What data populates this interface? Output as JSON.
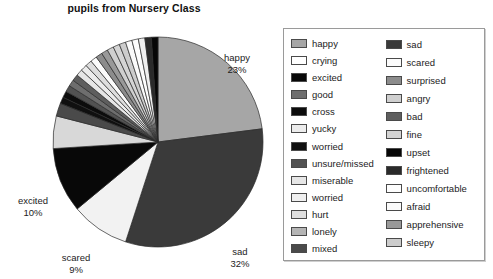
{
  "chart_data": {
    "type": "pie",
    "title": "pupils from Nursery Class",
    "xlabel": "",
    "ylabel": "",
    "legend_position": "right",
    "grid": false,
    "categories": [
      "happy",
      "crying",
      "excited",
      "good",
      "cross",
      "yucky",
      "worried",
      "unsure/missed",
      "miserable",
      "worried",
      "hurt",
      "lonely",
      "mixed",
      "sad",
      "scared",
      "surprised",
      "angry",
      "bad",
      "fine",
      "upset",
      "frightened",
      "uncomfortable",
      "afraid",
      "apprehensive",
      "sleepy"
    ],
    "values": [
      23,
      1,
      10,
      1,
      1,
      1,
      1,
      1,
      1,
      1,
      1,
      5,
      2,
      32,
      9,
      1,
      1,
      1,
      1,
      1,
      1,
      1,
      1,
      1,
      1
    ],
    "labeled_slices": [
      {
        "name": "happy",
        "percent": "23%",
        "value": 23
      },
      {
        "name": "sad",
        "percent": "32%",
        "value": 32
      },
      {
        "name": "scared",
        "percent": "9%",
        "value": 9
      },
      {
        "name": "excited",
        "percent": "10%",
        "value": 10
      }
    ],
    "slices": [
      {
        "label": "happy",
        "value": 23,
        "color": "#a6a6a6"
      },
      {
        "label": "sad",
        "value": 32,
        "color": "#3a3a3a"
      },
      {
        "label": "scared",
        "value": 9,
        "color": "#f2f2f2"
      },
      {
        "label": "excited",
        "value": 10,
        "color": "#080808"
      },
      {
        "label": "lonely",
        "value": 5,
        "color": "#d8d8d8"
      },
      {
        "label": "mixed",
        "value": 2,
        "color": "#4a4a4a"
      },
      {
        "label": "worried",
        "value": 1,
        "color": "#101010"
      },
      {
        "label": "cross",
        "value": 1,
        "color": "#0c0c0c"
      },
      {
        "label": "unsure/missed",
        "value": 1,
        "color": "#525252"
      },
      {
        "label": "good",
        "value": 1,
        "color": "#6e6e6e"
      },
      {
        "label": "bad",
        "value": 1,
        "color": "#5e5e5e"
      },
      {
        "label": "miserable",
        "value": 1,
        "color": "#e6e6e6"
      },
      {
        "label": "yucky",
        "value": 1,
        "color": "#ececec"
      },
      {
        "label": "hurt",
        "value": 1,
        "color": "#dedede"
      },
      {
        "label": "crying",
        "value": 1,
        "color": "#fbfbfb"
      },
      {
        "label": "surprised",
        "value": 1,
        "color": "#8c8c8c"
      },
      {
        "label": "apprehensive",
        "value": 1,
        "color": "#999999"
      },
      {
        "label": "angry",
        "value": 1,
        "color": "#cfcfcf"
      },
      {
        "label": "fine",
        "value": 1,
        "color": "#d4d4d4"
      },
      {
        "label": "sleepy",
        "value": 1,
        "color": "#cccccc"
      },
      {
        "label": "afraid",
        "value": 1,
        "color": "#fafafa"
      },
      {
        "label": "uncomfortable",
        "value": 1,
        "color": "#fdfdfd"
      },
      {
        "label": "worried2",
        "value": 1,
        "color": "#f0f0f0"
      },
      {
        "label": "frightened",
        "value": 1,
        "color": "#2a2a2a"
      },
      {
        "label": "upset",
        "value": 1,
        "color": "#060606"
      }
    ]
  },
  "title": "pupils from Nursery Class",
  "pie_labels": {
    "happy": {
      "name": "happy",
      "percent": "23%"
    },
    "sad": {
      "name": "sad",
      "percent": "32%"
    },
    "scared": {
      "name": "scared",
      "percent": "9%"
    },
    "excited": {
      "name": "excited",
      "percent": "10%"
    }
  },
  "legend": {
    "column_a": [
      {
        "label": "happy",
        "color": "#a6a6a6"
      },
      {
        "label": "crying",
        "color": "#ffffff"
      },
      {
        "label": "excited",
        "color": "#080808"
      },
      {
        "label": "good",
        "color": "#6e6e6e"
      },
      {
        "label": "cross",
        "color": "#0c0c0c"
      },
      {
        "label": "yucky",
        "color": "#ececec"
      },
      {
        "label": "worried",
        "color": "#101010"
      },
      {
        "label": "unsure/missed",
        "color": "#525252"
      },
      {
        "label": "miserable",
        "color": "#e6e6e6"
      },
      {
        "label": "worried",
        "color": "#f0f0f0"
      },
      {
        "label": "hurt",
        "color": "#dedede"
      },
      {
        "label": "lonely",
        "color": "#b5b5b5"
      },
      {
        "label": "mixed",
        "color": "#4a4a4a"
      }
    ],
    "column_b": [
      {
        "label": "sad",
        "color": "#3a3a3a"
      },
      {
        "label": "scared",
        "color": "#fbfbfb"
      },
      {
        "label": "surprised",
        "color": "#8c8c8c"
      },
      {
        "label": "angry",
        "color": "#cfcfcf"
      },
      {
        "label": "bad",
        "color": "#5e5e5e"
      },
      {
        "label": "fine",
        "color": "#d4d4d4"
      },
      {
        "label": "upset",
        "color": "#060606"
      },
      {
        "label": "frightened",
        "color": "#2a2a2a"
      },
      {
        "label": "uncomfortable",
        "color": "#fdfdfd"
      },
      {
        "label": "afraid",
        "color": "#fafafa"
      },
      {
        "label": "apprehensive",
        "color": "#999999"
      },
      {
        "label": "sleepy",
        "color": "#cccccc"
      }
    ]
  }
}
